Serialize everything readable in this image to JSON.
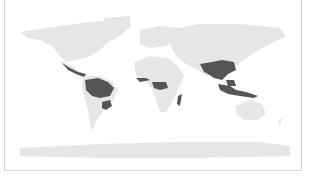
{
  "map": {
    "type": "choropleth world map",
    "projection": "equirectangular",
    "colors": {
      "background": "#ffffff",
      "land_default": "#e6e6e6",
      "highlighted": "#555555",
      "frame_border": "#d4d4d4"
    },
    "highlighted_regions": [
      "Central America / Mexico south",
      "Amazon basin (South America)",
      "Southern Brazil / Paraguay",
      "West Africa coast",
      "Central Africa (Congo basin)",
      "Madagascar",
      "South Asia / India",
      "Southeast Asia",
      "Indonesia / Papua"
    ]
  }
}
